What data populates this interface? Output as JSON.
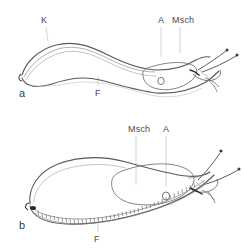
{
  "figure": {
    "type": "scientific-line-drawing",
    "background_color": "#ffffff",
    "ink_color": "#4a4a4a",
    "leader_line_color": "#c9c9c9",
    "panels": [
      {
        "id": "a",
        "letter": "a",
        "position": "top",
        "description": "slender slug with arched keeled back, lateral view facing right",
        "labels": [
          {
            "key": "K",
            "text": "K",
            "meaning": "Kiel (keel)",
            "x": 41,
            "y": 16,
            "leader": {
              "x1": 45,
              "y1": 27,
              "x2": 47,
              "y2": 40
            }
          },
          {
            "key": "A",
            "text": "A",
            "meaning": "Atemloch (pneumostome)",
            "x": 158,
            "y": 16,
            "leader": {
              "x1": 161,
              "y1": 27,
              "x2": 161,
              "y2": 56
            }
          },
          {
            "key": "Msch",
            "text": "Msch",
            "meaning": "Mantelschild (mantle shield)",
            "x": 172,
            "y": 16,
            "leader": {
              "x1": 180,
              "y1": 27,
              "x2": 180,
              "y2": 52
            }
          },
          {
            "key": "F",
            "text": "F",
            "meaning": "Fuss (foot / sole)",
            "x": 95,
            "y": 89,
            "leader": {
              "x1": 98,
              "y1": 86,
              "x2": 98,
              "y2": 75
            }
          }
        ]
      },
      {
        "id": "b",
        "letter": "b",
        "position": "bottom",
        "description": "broad rounded slug with fringed foot sole, lateral view facing right",
        "labels": [
          {
            "key": "Msch",
            "text": "Msch",
            "meaning": "Mantelschild (mantle shield)",
            "x": 128,
            "y": 125,
            "leader": {
              "x1": 136,
              "y1": 136,
              "x2": 136,
              "y2": 184
            }
          },
          {
            "key": "A",
            "text": "A",
            "meaning": "Atemloch (pneumostome)",
            "x": 163,
            "y": 125,
            "leader": {
              "x1": 166,
              "y1": 136,
              "x2": 166,
              "y2": 186
            }
          },
          {
            "key": "F",
            "text": "F",
            "meaning": "Fuss (foot / sole)",
            "x": 94,
            "y": 235,
            "leader": {
              "x1": 98,
              "y1": 232,
              "x2": 98,
              "y2": 218
            }
          }
        ]
      }
    ]
  }
}
